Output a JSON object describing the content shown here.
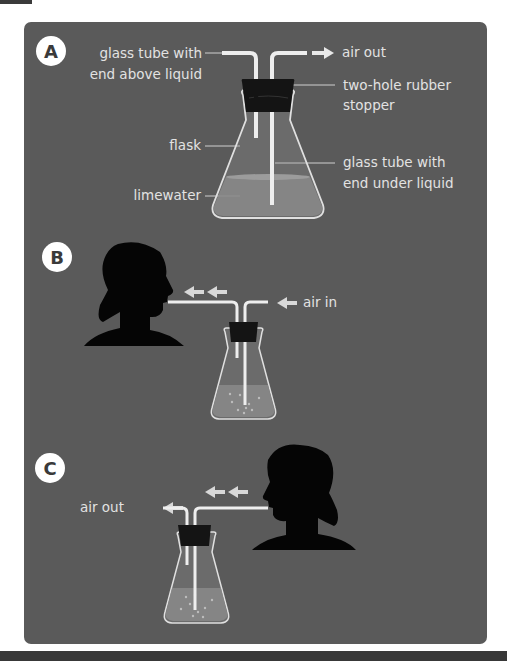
{
  "panels": {
    "a": {
      "badge": "A",
      "labels": {
        "glass_tube_above_1": "glass tube with",
        "glass_tube_above_2": "end above liquid",
        "air_out": "air out",
        "stopper_1": "two-hole rubber",
        "stopper_2": "stopper",
        "flask": "flask",
        "glass_tube_under_1": "glass tube with",
        "glass_tube_under_2": "end under liquid",
        "limewater": "limewater"
      }
    },
    "b": {
      "badge": "B",
      "labels": {
        "air_in": "air in"
      }
    },
    "c": {
      "badge": "C",
      "labels": {
        "air_out": "air out"
      }
    }
  },
  "colors": {
    "panel_bg": "#5a5a5a",
    "tube": "#eeeeee",
    "stopper": "#141414",
    "liquid": "#8a8a8a",
    "silhouette": "#050505",
    "badge_bg": "#ffffff"
  }
}
